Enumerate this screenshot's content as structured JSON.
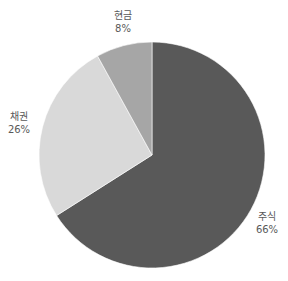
{
  "chart_data": {
    "type": "pie",
    "title": "",
    "categories": [
      "주식",
      "채권",
      "현금"
    ],
    "values": [
      66,
      26,
      8
    ],
    "value_labels": [
      "66%",
      "26%",
      "8%"
    ],
    "colors": [
      "#595959",
      "#d9d9d9",
      "#a6a6a6"
    ],
    "start_angle_deg": 0,
    "direction": "clockwise",
    "legend": "none"
  },
  "labels": {
    "stocks": {
      "name": "주식",
      "pct": "66%"
    },
    "bonds": {
      "name": "채권",
      "pct": "26%"
    },
    "cash": {
      "name": "현금",
      "pct": "8%"
    }
  }
}
